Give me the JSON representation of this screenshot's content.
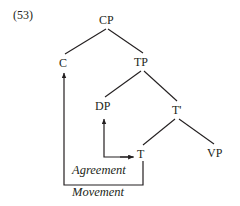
{
  "figure": {
    "example_number": "(53)",
    "type": "syntax-tree",
    "nodes": [
      {
        "id": "cp",
        "label": "CP"
      },
      {
        "id": "c",
        "label": "C"
      },
      {
        "id": "tp",
        "label": "TP"
      },
      {
        "id": "dp",
        "label": "DP"
      },
      {
        "id": "tbar",
        "label": "T'"
      },
      {
        "id": "t",
        "label": "T"
      },
      {
        "id": "vp",
        "label": "VP"
      }
    ],
    "relations": [
      {
        "id": "agreement",
        "label": "Agreement",
        "from": "t",
        "to": "dp"
      },
      {
        "id": "movement",
        "label": "Movement",
        "from": "t",
        "to": "c"
      }
    ],
    "colors": {
      "ink": "#231f20",
      "background": "#ffffff"
    }
  }
}
